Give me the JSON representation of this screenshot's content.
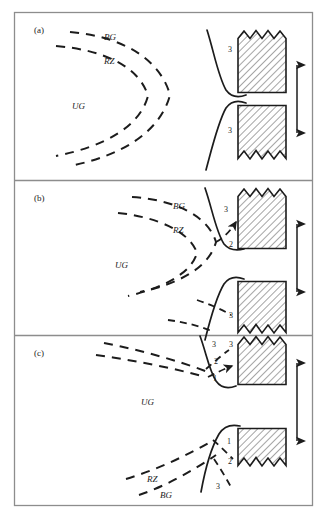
{
  "figure": {
    "type": "schematic-diagram",
    "border_color": "#888888",
    "line_color": "#1c1c1c",
    "hatch_color": "#555555",
    "block_fill": "#ffffff"
  },
  "panels": [
    {
      "id": "a",
      "letter": "(a)",
      "zone_labels": [
        {
          "text": "BG",
          "x": 104,
          "y": 39
        },
        {
          "text": "RZ",
          "x": 104,
          "y": 63
        },
        {
          "text": "UG",
          "x": 77,
          "y": 108
        }
      ],
      "num_labels": [
        {
          "text": "3",
          "x": 228,
          "y": 50
        },
        {
          "text": "3",
          "x": 228,
          "y": 131
        }
      ]
    },
    {
      "id": "b",
      "letter": "(b)",
      "zone_labels": [
        {
          "text": "BG",
          "x": 173,
          "y": 208
        },
        {
          "text": "RZ",
          "x": 173,
          "y": 232
        },
        {
          "text": "UG",
          "x": 120,
          "y": 267
        }
      ],
      "num_labels": [
        {
          "text": "3",
          "x": 224,
          "y": 210
        },
        {
          "text": "2",
          "x": 229,
          "y": 245
        },
        {
          "text": "3",
          "x": 229,
          "y": 316
        },
        {
          "text": "3",
          "x": 229,
          "y": 345
        }
      ]
    },
    {
      "id": "c",
      "letter": "(c)",
      "zone_labels": [
        {
          "text": "UG",
          "x": 146,
          "y": 404
        },
        {
          "text": "RZ",
          "x": 152,
          "y": 481
        },
        {
          "text": "BG",
          "x": 165,
          "y": 497
        }
      ],
      "num_labels": [
        {
          "text": "3",
          "x": 212,
          "y": 345
        },
        {
          "text": "2",
          "x": 214,
          "y": 362
        },
        {
          "text": "1",
          "x": 213,
          "y": 379
        },
        {
          "text": "1",
          "x": 227,
          "y": 442
        },
        {
          "text": "2",
          "x": 228,
          "y": 462
        },
        {
          "text": "3",
          "x": 216,
          "y": 487
        }
      ]
    }
  ],
  "arrows": {
    "name": "double-headed-vertical-arrow",
    "count": 3,
    "description": "Double headed vertical arrow between upper and lower coal blocks in each panel"
  },
  "legend_terms": {
    "BG": "BG",
    "RZ": "RZ",
    "UG": "UG"
  }
}
